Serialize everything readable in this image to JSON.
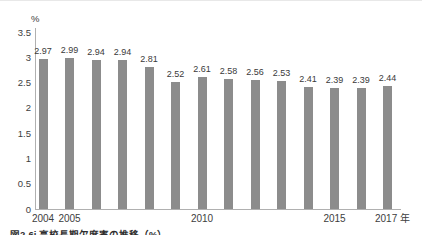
{
  "chart_data": {
    "type": "bar",
    "title": "図2-6i 高校長期欠席率の推移（%）",
    "unit_label": "%",
    "categories": [
      "2004",
      "2005",
      "2006",
      "2007",
      "2008",
      "2009",
      "2010",
      "2011",
      "2012",
      "2013",
      "2014",
      "2015",
      "2016",
      "2017"
    ],
    "values": [
      2.97,
      2.99,
      2.94,
      2.94,
      2.81,
      2.52,
      2.61,
      2.58,
      2.56,
      2.53,
      2.41,
      2.39,
      2.39,
      2.44
    ],
    "value_labels": [
      "2.97",
      "2.99",
      "2.94",
      "2.94",
      "2.81",
      "2.52",
      "2.61",
      "2.58",
      "2.56",
      "2.53",
      "2.41",
      "2.39",
      "2.39",
      "2.44"
    ],
    "x_tick_labels": [
      "2004",
      "2005",
      "",
      "",
      "",
      "",
      "2010",
      "",
      "",
      "",
      "",
      "2015",
      "",
      "2017"
    ],
    "x_axis_suffix": "年",
    "y_ticks": [
      "3.5",
      "3",
      "2.5",
      "2",
      "1.5",
      "1",
      "0.5",
      "0"
    ],
    "ylim": [
      0,
      3.5
    ],
    "grid": "off",
    "legend": "none",
    "bar_color": "#8c8c8c",
    "axis_color": "#b0b0b0",
    "text_color": "#3d3d3d"
  }
}
